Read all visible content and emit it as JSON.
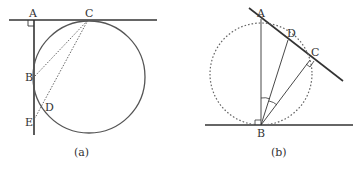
{
  "panels": [
    {
      "id": "a",
      "caption": "(a)",
      "labels": {
        "A": "A",
        "B": "B",
        "C": "C",
        "D": "D",
        "E": "E"
      }
    },
    {
      "id": "b",
      "caption": "(b)",
      "labels": {
        "A": "A",
        "B": "B",
        "C": "C",
        "D": "D"
      }
    }
  ],
  "colors": {
    "stroke": "#333333",
    "circle": "#555555",
    "dotted": "#666666"
  }
}
